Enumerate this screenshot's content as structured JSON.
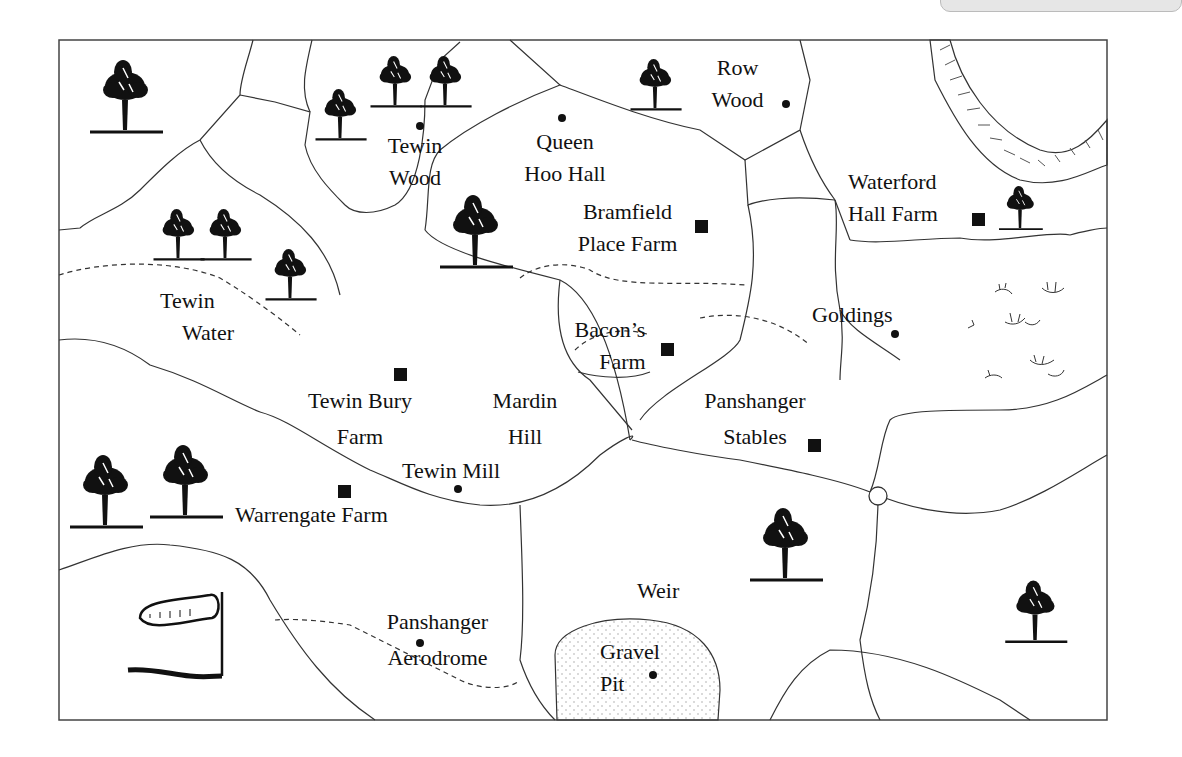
{
  "labels": {
    "tewin_wood": [
      "Tewin",
      "Wood"
    ],
    "queen_hoo_hall": [
      "Queen",
      "Hoo Hall"
    ],
    "bramfield_place_farm": [
      "Bramfield",
      "Place Farm"
    ],
    "row_wood": [
      "Row",
      "Wood"
    ],
    "waterford_hall_farm": [
      "Waterford",
      "Hall Farm"
    ],
    "tewin_water": [
      "Tewin",
      "Water"
    ],
    "bacons_farm": [
      "Bacon’s",
      "Farm"
    ],
    "goldings": "Goldings",
    "tewin_bury_farm": [
      "Tewin Bury",
      "Farm"
    ],
    "mardin_hill": [
      "Mardin",
      "Hill"
    ],
    "tewin_mill": "Tewin Mill",
    "panshanger_stables": [
      "Panshanger",
      "Stables"
    ],
    "warrengate_farm": "Warrengate Farm",
    "weir": "Weir",
    "panshanger_aerodrome": [
      "Panshanger",
      "Aerodrome"
    ],
    "gravel_pit": [
      "Gravel",
      "Pit"
    ]
  },
  "colors": {
    "ink": "#111111",
    "border": "#444444",
    "background": "#ffffff"
  }
}
